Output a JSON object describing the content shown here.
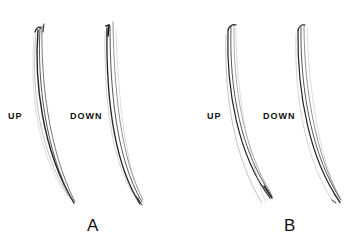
{
  "figure": {
    "panels": [
      {
        "id": "A",
        "letter": "A",
        "up_label": "UP",
        "down_label": "DOWN"
      },
      {
        "id": "B",
        "letter": "B",
        "up_label": "UP",
        "down_label": "DOWN"
      }
    ],
    "colors": {
      "background": "#ffffff",
      "ink": "#111111",
      "stroke_light": "#888888"
    }
  }
}
